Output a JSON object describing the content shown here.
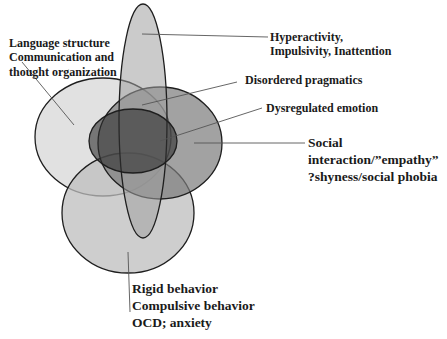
{
  "diagram": {
    "type": "venn",
    "labels": {
      "language": [
        "Language structure",
        "Communication and",
        "thought organization"
      ],
      "hyperactivity": [
        "Hyperactivity,",
        "Impulsivity, Inattention"
      ],
      "pragmatics": [
        "Disordered pragmatics"
      ],
      "emotion": [
        "Dysregulated emotion"
      ],
      "social": [
        "Social",
        "interaction/”empathy”",
        "?shyness/social phobia"
      ],
      "rigid": [
        "Rigid behavior",
        "Compulsive behavior",
        "OCD; anxiety"
      ]
    },
    "colors": {
      "language_fill": "#d9d9d9",
      "social_fill": "#8a8a8a",
      "rigid_fill": "#c4c4c4",
      "ellipse_fill": "#a8a8a8",
      "center_fill": "#4a4a4a",
      "stroke": "#1e1e1e",
      "leader": "#555555"
    }
  }
}
